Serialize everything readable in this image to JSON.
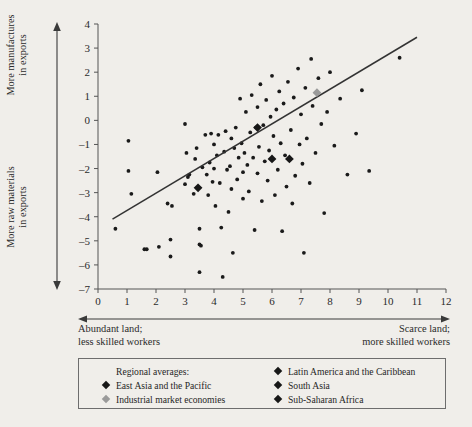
{
  "axes": {
    "y_label_top": "More manufactures\nin exports",
    "y_label_top_line1": "More manufactures",
    "y_label_top_line2": "in exports",
    "y_label_bottom_line1": "More raw materials",
    "y_label_bottom_line2": "in exports",
    "x_label_left_line1": "Abundant land;",
    "x_label_left_line2": "less skilled workers",
    "x_label_right_line1": "Scarce land;",
    "x_label_right_line2": "more skilled workers"
  },
  "legend": {
    "header": "Regional averages:",
    "items": [
      {
        "label": "East Asia and the Pacific",
        "color": "#171717",
        "column": "left"
      },
      {
        "label": "Industrial market economies",
        "color": "#9a9a9a",
        "column": "left"
      },
      {
        "label": "Latin America and the Caribbean",
        "color": "#171717",
        "column": "right"
      },
      {
        "label": "South Asia",
        "color": "#171717",
        "column": "right"
      },
      {
        "label": "Sub-Saharan Africa",
        "color": "#171717",
        "column": "right"
      }
    ]
  },
  "chart_data": {
    "type": "scatter",
    "title": "",
    "xlabel": "Abundant land; less skilled workers  →  Scarce land; more skilled workers",
    "ylabel": "More raw materials in exports  →  More manufactures in exports",
    "xlim": [
      0,
      12
    ],
    "ylim": [
      -7,
      4
    ],
    "xticks": [
      0,
      1,
      2,
      3,
      4,
      5,
      6,
      7,
      8,
      9,
      10,
      11,
      12
    ],
    "yticks": [
      -7,
      -6,
      -5,
      -4,
      -3,
      -2,
      -1,
      0,
      1,
      2,
      3,
      4
    ],
    "grid": false,
    "legend_position": "below-plot",
    "marker_color": "#1a1a1a",
    "line_color": "#333333",
    "trend_line": {
      "x0": 0.5,
      "y0": -4.1,
      "x1": 11.0,
      "y1": 3.45
    },
    "points": [
      [
        1.05,
        -0.85
      ],
      [
        1.05,
        -2.1
      ],
      [
        1.15,
        -3.05
      ],
      [
        0.6,
        -4.5
      ],
      [
        1.6,
        -5.35
      ],
      [
        1.68,
        -5.35
      ],
      [
        2.05,
        -2.15
      ],
      [
        2.1,
        -5.25
      ],
      [
        2.4,
        -3.45
      ],
      [
        2.5,
        -4.95
      ],
      [
        2.55,
        -3.55
      ],
      [
        2.5,
        -5.65
      ],
      [
        3.0,
        -0.15
      ],
      [
        3.05,
        -1.35
      ],
      [
        3.1,
        -2.35
      ],
      [
        3.0,
        -2.65
      ],
      [
        3.15,
        -2.25
      ],
      [
        3.3,
        -3.05
      ],
      [
        3.35,
        -1.6
      ],
      [
        3.4,
        -1.15
      ],
      [
        3.45,
        -2.8
      ],
      [
        3.5,
        -4.5
      ],
      [
        3.5,
        -5.15
      ],
      [
        3.55,
        -5.2
      ],
      [
        3.5,
        -6.3
      ],
      [
        3.6,
        -1.95
      ],
      [
        3.7,
        -0.6
      ],
      [
        3.75,
        -2.25
      ],
      [
        3.8,
        -3.1
      ],
      [
        3.85,
        -1.75
      ],
      [
        3.9,
        -0.55
      ],
      [
        3.95,
        -2.55
      ],
      [
        4.0,
        -1.0
      ],
      [
        4.0,
        -2.0
      ],
      [
        4.05,
        -3.55
      ],
      [
        4.1,
        -1.45
      ],
      [
        4.15,
        -0.6
      ],
      [
        4.2,
        -2.6
      ],
      [
        4.25,
        -4.45
      ],
      [
        4.3,
        -6.5
      ],
      [
        4.35,
        -1.3
      ],
      [
        4.4,
        -0.45
      ],
      [
        4.45,
        -2.05
      ],
      [
        4.5,
        -3.8
      ],
      [
        4.55,
        -1.9
      ],
      [
        4.6,
        -0.75
      ],
      [
        4.6,
        -2.85
      ],
      [
        4.65,
        -5.5
      ],
      [
        4.7,
        -1.15
      ],
      [
        4.75,
        -0.3
      ],
      [
        4.8,
        -2.45
      ],
      [
        4.85,
        -1.55
      ],
      [
        4.9,
        0.9
      ],
      [
        4.95,
        -0.95
      ],
      [
        5.0,
        -2.15
      ],
      [
        5.0,
        -3.25
      ],
      [
        5.05,
        -1.35
      ],
      [
        5.1,
        0.35
      ],
      [
        5.15,
        -1.85
      ],
      [
        5.2,
        -2.95
      ],
      [
        5.25,
        -0.5
      ],
      [
        5.3,
        1.05
      ],
      [
        5.35,
        -1.55
      ],
      [
        5.4,
        -4.55
      ],
      [
        5.45,
        -0.3
      ],
      [
        5.5,
        0.55
      ],
      [
        5.5,
        -2.2
      ],
      [
        5.55,
        -1.1
      ],
      [
        5.6,
        1.5
      ],
      [
        5.65,
        -3.35
      ],
      [
        5.7,
        -0.2
      ],
      [
        5.75,
        -1.7
      ],
      [
        5.8,
        0.85
      ],
      [
        5.85,
        -2.5
      ],
      [
        5.9,
        -1.25
      ],
      [
        5.95,
        0.15
      ],
      [
        6.0,
        1.85
      ],
      [
        6.0,
        -1.6
      ],
      [
        6.05,
        -0.65
      ],
      [
        6.1,
        -3.1
      ],
      [
        6.15,
        0.45
      ],
      [
        6.2,
        -2.05
      ],
      [
        6.25,
        1.2
      ],
      [
        6.3,
        -0.95
      ],
      [
        6.35,
        -4.6
      ],
      [
        6.4,
        0.7
      ],
      [
        6.45,
        -1.45
      ],
      [
        6.5,
        -2.75
      ],
      [
        6.55,
        1.6
      ],
      [
        6.6,
        -1.6
      ],
      [
        6.65,
        -0.4
      ],
      [
        6.7,
        -3.45
      ],
      [
        6.75,
        0.95
      ],
      [
        6.8,
        -2.3
      ],
      [
        6.9,
        2.15
      ],
      [
        6.95,
        -1.0
      ],
      [
        7.0,
        0.25
      ],
      [
        7.05,
        -1.8
      ],
      [
        7.1,
        -5.5
      ],
      [
        7.15,
        1.35
      ],
      [
        7.2,
        -0.75
      ],
      [
        7.3,
        -2.6
      ],
      [
        7.35,
        2.55
      ],
      [
        7.4,
        0.6
      ],
      [
        7.5,
        -1.35
      ],
      [
        7.6,
        1.75
      ],
      [
        7.7,
        -0.15
      ],
      [
        7.8,
        -3.85
      ],
      [
        7.9,
        0.35
      ],
      [
        8.0,
        2.0
      ],
      [
        8.15,
        -1.05
      ],
      [
        8.35,
        0.9
      ],
      [
        8.6,
        -2.25
      ],
      [
        8.9,
        -0.55
      ],
      [
        9.1,
        1.25
      ],
      [
        9.35,
        -2.1
      ],
      [
        10.4,
        2.6
      ]
    ],
    "regional_averages": [
      {
        "name": "East Asia and the Pacific",
        "x": 6.6,
        "y": -1.6,
        "color": "#171717"
      },
      {
        "name": "Industrial market economies",
        "x": 7.55,
        "y": 1.15,
        "color": "#9a9a9a"
      },
      {
        "name": "Latin America and the Caribbean",
        "x": 6.0,
        "y": -1.6,
        "color": "#171717"
      },
      {
        "name": "South Asia",
        "x": 5.5,
        "y": -0.3,
        "color": "#171717"
      },
      {
        "name": "Sub-Saharan Africa",
        "x": 3.45,
        "y": -2.8,
        "color": "#171717"
      }
    ]
  }
}
